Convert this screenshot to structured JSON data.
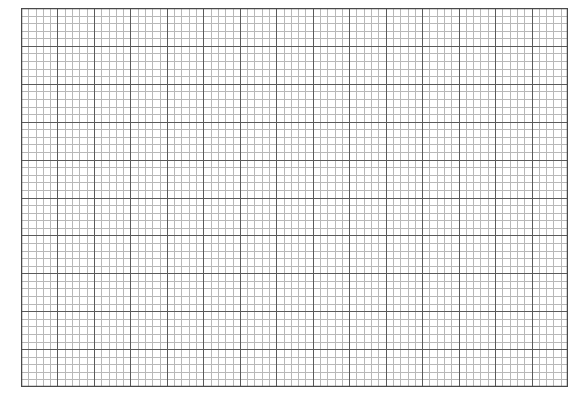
{
  "grid": {
    "major_columns": 15,
    "major_rows": 10,
    "minor_per_major": 5,
    "colors": {
      "background": "#ffffff",
      "minor_line": "#b8b8b8",
      "major_line": "#5a5a5a",
      "border": "#4a4a4a"
    }
  }
}
